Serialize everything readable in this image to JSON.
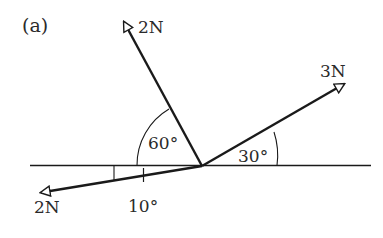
{
  "figure_label": "(a)",
  "forces": [
    {
      "id": "force-top",
      "magnitude_label": "2N",
      "tip": [
        122,
        20
      ]
    },
    {
      "id": "force-right",
      "magnitude_label": "3N",
      "tip": [
        346,
        83
      ]
    },
    {
      "id": "force-bottom-left",
      "magnitude_label": "2N",
      "tip": [
        39,
        193
      ]
    }
  ],
  "angles": [
    {
      "id": "angle-60",
      "label": "60°"
    },
    {
      "id": "angle-30",
      "label": "30°"
    },
    {
      "id": "angle-10",
      "label": "10°"
    }
  ],
  "colors": {
    "stroke": "#1a1a1a",
    "text": "#2a2a2a",
    "background": "#ffffff"
  }
}
